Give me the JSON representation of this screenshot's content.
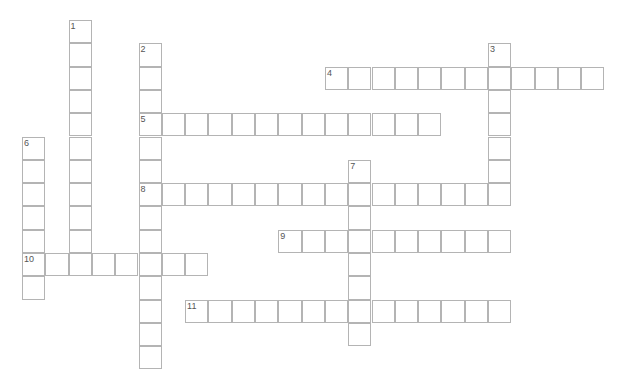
{
  "puzzle": {
    "type": "crossword",
    "cell_size": 23.3,
    "origin": {
      "x": 22,
      "y": 20
    },
    "colors": {
      "border": "#b4b4b4",
      "cell_bg": "#ffffff",
      "number": "#555555"
    },
    "words": [
      {
        "number": "1",
        "direction": "down",
        "row": 0,
        "col": 2,
        "length": 11
      },
      {
        "number": "2",
        "direction": "down",
        "row": 1,
        "col": 5,
        "length": 14
      },
      {
        "number": "3",
        "direction": "down",
        "row": 1,
        "col": 20,
        "length": 7
      },
      {
        "number": "4",
        "direction": "across",
        "row": 2,
        "col": 13,
        "length": 12
      },
      {
        "number": "5",
        "direction": "across",
        "row": 4,
        "col": 5,
        "length": 13
      },
      {
        "number": "6",
        "direction": "down",
        "row": 5,
        "col": 0,
        "length": 7
      },
      {
        "number": "7",
        "direction": "down",
        "row": 6,
        "col": 14,
        "length": 8
      },
      {
        "number": "8",
        "direction": "across",
        "row": 7,
        "col": 5,
        "length": 16
      },
      {
        "number": "9",
        "direction": "across",
        "row": 9,
        "col": 11,
        "length": 10
      },
      {
        "number": "10",
        "direction": "across",
        "row": 10,
        "col": 0,
        "length": 8
      },
      {
        "number": "11",
        "direction": "across",
        "row": 12,
        "col": 7,
        "length": 14
      }
    ]
  }
}
